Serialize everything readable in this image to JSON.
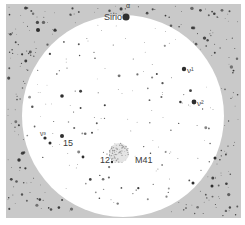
{
  "chart": {
    "frame": {
      "x": 6,
      "y": 4,
      "w": 235,
      "h": 214,
      "color": "#c9c9c9"
    },
    "field_circle": {
      "cx": 123,
      "cy": 116,
      "r": 101,
      "color": "#ffffff"
    },
    "star_color": "#2e2e2e",
    "cluster": {
      "name": "M41",
      "cx": 119,
      "cy": 153,
      "r": 10,
      "color": "#9a9a9a"
    },
    "labels": [
      {
        "id": "alpha",
        "text": "α",
        "x": 126,
        "y": 8,
        "size": 7
      },
      {
        "id": "sirio",
        "text": "Sirio",
        "x": 104,
        "y": 20,
        "size": 9
      },
      {
        "id": "nu1",
        "text": "ν¹",
        "x": 187,
        "y": 73,
        "size": 8
      },
      {
        "id": "nu2",
        "text": "ν²",
        "x": 197,
        "y": 106,
        "size": 8
      },
      {
        "id": "nu3",
        "text": "ν³",
        "x": 40,
        "y": 136,
        "size": 7
      },
      {
        "id": "15",
        "text": "15",
        "x": 63,
        "y": 146,
        "size": 9
      },
      {
        "id": "12",
        "text": "12",
        "x": 100,
        "y": 163,
        "size": 9
      },
      {
        "id": "m41",
        "text": "M41",
        "x": 135,
        "y": 163,
        "size": 9
      }
    ],
    "bright_stars": [
      {
        "name": "Sirio",
        "x": 126,
        "y": 17,
        "r": 3.6
      },
      {
        "name": "nu1",
        "x": 184,
        "y": 69,
        "r": 2.2
      },
      {
        "name": "nu2",
        "x": 194,
        "y": 102,
        "r": 2.4
      },
      {
        "name": "15",
        "x": 62,
        "y": 136,
        "r": 2
      },
      {
        "name": "nu3",
        "x": 45,
        "y": 138,
        "r": 1.6
      },
      {
        "name": "star-a",
        "x": 38,
        "y": 30,
        "r": 2
      },
      {
        "name": "star-b",
        "x": 62,
        "y": 96,
        "r": 1.8
      },
      {
        "name": "star-c",
        "x": 50,
        "y": 143,
        "r": 1.5
      },
      {
        "name": "star-d",
        "x": 215,
        "y": 158,
        "r": 1.5
      },
      {
        "name": "star-e",
        "x": 212,
        "y": 186,
        "r": 1.5
      },
      {
        "name": "star-f",
        "x": 193,
        "y": 183,
        "r": 1.5
      },
      {
        "name": "star-g",
        "x": 83,
        "y": 157,
        "r": 1.4
      },
      {
        "name": "star-h",
        "x": 112,
        "y": 162,
        "r": 1.2
      }
    ],
    "faint_stars_seed": 7,
    "faint_star_count_inside": 150,
    "faint_star_count_outside": 230
  }
}
